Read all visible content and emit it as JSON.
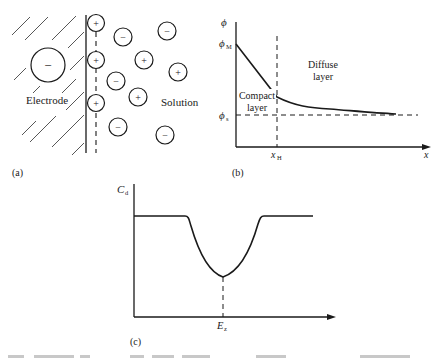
{
  "panel_a": {
    "label": "(a)",
    "electrode_label": "Electrode",
    "solution_label": "Solution",
    "electrode_charge": "−",
    "adsorbed_ions": [
      {
        "sign": "+",
        "cx": 96,
        "cy": 23
      },
      {
        "sign": "+",
        "cx": 96,
        "cy": 60
      },
      {
        "sign": "+",
        "cx": 96,
        "cy": 103
      }
    ],
    "solution_ions": [
      {
        "sign": "−",
        "cx": 123,
        "cy": 37
      },
      {
        "sign": "−",
        "cx": 167,
        "cy": 31
      },
      {
        "sign": "+",
        "cx": 144,
        "cy": 60
      },
      {
        "sign": "+",
        "cx": 178,
        "cy": 72
      },
      {
        "sign": "−",
        "cx": 116,
        "cy": 81
      },
      {
        "sign": "+",
        "cx": 138,
        "cy": 97
      },
      {
        "sign": "−",
        "cx": 118,
        "cy": 127
      },
      {
        "sign": "−",
        "cx": 165,
        "cy": 135
      }
    ]
  },
  "panel_b": {
    "label": "(b)",
    "y_axis_label": "ϕ",
    "phi_M_label": "ϕ",
    "phi_M_sub": "M",
    "phi_s_label": "ϕ",
    "phi_s_sub": "s",
    "x_axis_label": "x",
    "x_H_label": "x",
    "x_H_sub": "H",
    "compact_layer_line1": "Compact",
    "compact_layer_line2": "layer",
    "diffuse_layer_line1": "Diffuse",
    "diffuse_layer_line2": "layer"
  },
  "panel_c": {
    "label": "(c)",
    "y_axis_label": "C",
    "y_axis_sub": "d",
    "x_marker_label": "E",
    "x_marker_sub": "z"
  }
}
